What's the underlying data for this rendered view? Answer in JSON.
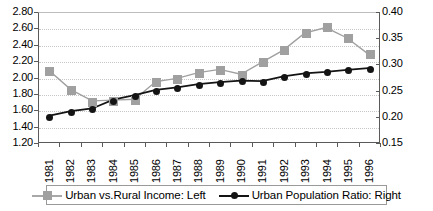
{
  "chart_data": {
    "type": "line",
    "title": "",
    "xlabel": "",
    "ylabel": "",
    "grid": true,
    "legend_position": "bottom",
    "categories": [
      "1981",
      "1982",
      "1983",
      "1984",
      "1985",
      "1986",
      "1987",
      "1988",
      "1989",
      "1990",
      "1991",
      "1992",
      "1993",
      "1994",
      "1995",
      "1996"
    ],
    "axes": {
      "left": {
        "label": "",
        "ylim": [
          1.2,
          2.8
        ],
        "ticks": [
          "2.80",
          "2.60",
          "2.40",
          "2.20",
          "2.00",
          "1.80",
          "1.60",
          "1.40",
          "1.20"
        ],
        "tick_values": [
          2.8,
          2.6,
          2.4,
          2.2,
          2.0,
          1.8,
          1.6,
          1.4,
          1.2
        ]
      },
      "right": {
        "label": "",
        "ylim": [
          0.15,
          0.4
        ],
        "ticks": [
          "0.40",
          "0.35",
          "0.30",
          "0.25",
          "0.20",
          "0.15"
        ],
        "tick_values": [
          0.4,
          0.35,
          0.3,
          0.25,
          0.2,
          0.15
        ]
      }
    },
    "series": [
      {
        "name": "Urban vs.Rural Income: Left",
        "axis": "left",
        "color": "#a0a0a0",
        "marker": "square",
        "values": [
          2.08,
          1.85,
          1.71,
          1.72,
          1.73,
          1.95,
          1.99,
          2.06,
          2.1,
          2.04,
          2.19,
          2.34,
          2.55,
          2.62,
          2.49,
          2.29
        ]
      },
      {
        "name": "Urban Population Ratio: Right",
        "axis": "right",
        "color": "#141414",
        "marker": "circle",
        "values": [
          0.201,
          0.21,
          0.215,
          0.232,
          0.241,
          0.251,
          0.256,
          0.262,
          0.266,
          0.269,
          0.268,
          0.277,
          0.283,
          0.286,
          0.29,
          0.293
        ]
      }
    ]
  },
  "legend": {
    "entries": [
      {
        "label": "Urban vs.Rural Income: Left",
        "marker": "square-marker",
        "color": "#a0a0a0"
      },
      {
        "label": "Urban Population Ratio: Right",
        "marker": "circle-marker",
        "color": "#141414"
      }
    ]
  }
}
